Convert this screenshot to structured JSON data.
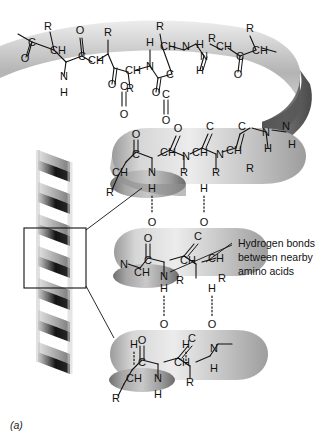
{
  "figure": {
    "label": "(a)",
    "kind": "alpha-helix-protein-secondary-structure",
    "background_color": "#ffffff",
    "ink_color": "#111111"
  },
  "annotation": {
    "lines": [
      "Hydrogen bonds",
      "between nearby",
      "amino acids"
    ],
    "line1": "Hydrogen bonds",
    "line2": "between nearby",
    "line3": "amino acids"
  },
  "ribbon": {
    "palette": {
      "light": "#e9e9e9",
      "mid": "#c2c2c2",
      "dark": "#8d8d8d",
      "shadow": "#6a6a6a",
      "deep": "#4a4a4a"
    }
  },
  "small_helix": {
    "palette": {
      "front": "#1a1a1a",
      "back": "#9a9a9a",
      "edge": "#d8d8d8"
    }
  },
  "atoms": {
    "carbon": "C",
    "hydrogen": "H",
    "nitrogen": "N",
    "oxygen": "O",
    "side_chain": "R",
    "methine": "CH"
  },
  "top_ribbon_chain": [
    "C",
    "O",
    "CH",
    "R",
    "N",
    "H",
    "C",
    "O",
    "CH",
    "R",
    "N",
    "H",
    "C",
    "O",
    "CH",
    "R",
    "N",
    "H",
    "C",
    "O",
    "CH",
    "R",
    "N",
    "H",
    "C",
    "O",
    "CH",
    "R",
    "N",
    "H",
    "C",
    "O",
    "CH",
    "R"
  ],
  "turn2_chain": [
    "O",
    "C",
    "CH",
    "R",
    "N",
    "H",
    "O",
    "C",
    "CH",
    "R",
    "N",
    "H",
    "O",
    "C",
    "CH",
    "R",
    "N",
    "H",
    "O",
    "C",
    "CH",
    "R",
    "N",
    "H"
  ],
  "turn3_chain": [
    "O",
    "C",
    "CH",
    "R",
    "N",
    "H",
    "O",
    "C",
    "CH",
    "R",
    "N",
    "H"
  ],
  "turn4_chain": [
    "O",
    "C",
    "CH",
    "R",
    "N",
    "H",
    "O",
    "C",
    "CH",
    "R",
    "N",
    "H"
  ],
  "hydrogen_bonds": {
    "count": 6,
    "donor": "H",
    "acceptor": "O",
    "style": "dotted"
  }
}
